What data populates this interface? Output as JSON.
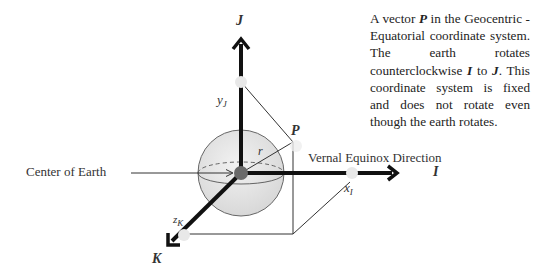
{
  "caption": {
    "parts": [
      {
        "text": "A vector ",
        "style": "normal"
      },
      {
        "text": "P",
        "style": "bold-italic"
      },
      {
        "text": " in the Geocentric - Equatorial coordinate system.  The earth rotates counterclockwise ",
        "style": "normal"
      },
      {
        "text": "I",
        "style": "bold-italic"
      },
      {
        "text": " to ",
        "style": "normal"
      },
      {
        "text": "J",
        "style": "bold-italic"
      },
      {
        "text": ". This coordinate system is fixed and does not rotate even though the earth rotates.",
        "style": "normal"
      }
    ]
  },
  "labels": {
    "center_of_earth": "Center of Earth",
    "vernal_equinox": "Vernal Equinox Direction",
    "axis_i": "I",
    "axis_j": "J",
    "axis_k": "K",
    "vector_p": "P",
    "radius": "r",
    "x_component": {
      "base": "x",
      "sub": "I"
    },
    "y_component": {
      "base": "y",
      "sub": "J"
    },
    "z_component": {
      "base": "z",
      "sub": "K"
    }
  },
  "colors": {
    "axis": "#111111",
    "sphere_fill": "#e2e2e2",
    "sphere_stroke": "#555555",
    "marker": "#e6e6e6",
    "center_dot": "#6a6a6a",
    "line": "#333333"
  }
}
